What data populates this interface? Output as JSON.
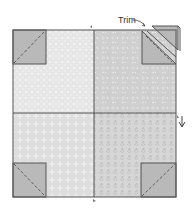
{
  "diagram": {
    "type": "quilt-block",
    "annotation": "Trim",
    "colors": {
      "outline": "#555555",
      "corner": "#b9b9b9",
      "fabric_top_left": "#e6e6e6",
      "fabric_top_right": "#cfcfcf",
      "fabric_bottom_left": "#dedede",
      "fabric_bottom_right": "#d6d6d6",
      "background": "#ffffff"
    },
    "quadrants": [
      "top-left",
      "top-right",
      "bottom-left",
      "bottom-right"
    ],
    "corners": [
      "top-left",
      "top-right",
      "bottom-left",
      "bottom-right"
    ]
  }
}
